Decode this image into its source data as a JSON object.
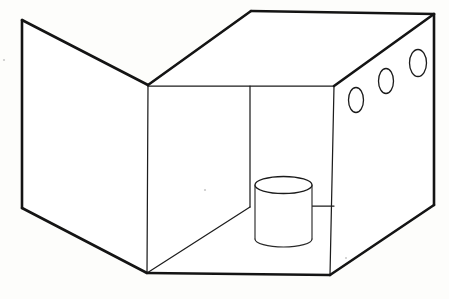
{
  "document": {
    "title": "Open-box perspective line drawing",
    "subject": "three-dimensional box with open front, three circular holes on right wall, and a cylinder resting on the floor",
    "style": "black ink line drawing on white paper",
    "canvas": {
      "width": 449,
      "height": 299
    },
    "background_color": "#fdfdfb",
    "ink_color": "#141414"
  },
  "geometry": {
    "vertices": {
      "left_panel_top_outer": [
        22,
        20
      ],
      "left_panel_bottom_outer": [
        22,
        208
      ],
      "left_panel_top_inner": [
        148,
        85
      ],
      "left_panel_bottom_inner": [
        147,
        273
      ],
      "top_face_back_left": [
        251,
        11
      ],
      "top_face_back_right": [
        434,
        14
      ],
      "right_wall_top_front": [
        334,
        86
      ],
      "right_wall_bottom_outer": [
        434,
        205
      ],
      "floor_front_right": [
        330,
        275
      ],
      "back_wall_divider_top": [
        250,
        86
      ],
      "back_wall_divider_bottom": [
        250,
        207
      ]
    },
    "outer_outline_points": "22,20 148,85 251,11 434,14 434,205 330,275 147,273 22,208 22,20",
    "thick_edges": [
      {
        "name": "left-panel-left-edge",
        "points": "22,20 22,208"
      },
      {
        "name": "left-panel-top-edge",
        "points": "22,20 148,85"
      },
      {
        "name": "left-panel-bottom-edge",
        "points": "22,208 147,273"
      },
      {
        "name": "top-face-back-left-edge",
        "points": "148,85 251,11"
      },
      {
        "name": "top-face-back-edge",
        "points": "251,11 434,14"
      },
      {
        "name": "top-face-right-edge",
        "points": "434,14 334,86"
      },
      {
        "name": "right-wall-outer-edge",
        "points": "434,14 434,205"
      },
      {
        "name": "right-wall-bottom-edge",
        "points": "434,205 330,275"
      },
      {
        "name": "floor-front-edge",
        "points": "147,273 330,275"
      }
    ],
    "thin_edges": [
      {
        "name": "back-wall-top-rail",
        "points": "148,86 334,86"
      },
      {
        "name": "interior-left-wall-vertical",
        "points": "148,85 147,273"
      },
      {
        "name": "interior-right-wall-vertical",
        "points": "334,86 330,275"
      },
      {
        "name": "back-wall-vertical-divider",
        "points": "250,86 250,207"
      },
      {
        "name": "floor-diagonal",
        "points": "147,273 250,207"
      },
      {
        "name": "floor-right-ledge",
        "points": "312,206 334,206"
      }
    ]
  },
  "objects": {
    "cylinder": {
      "label": "cylinder",
      "center_x": 283.5,
      "top_ellipse_cy": 185,
      "rx": 28.5,
      "ry": 8.5,
      "body_bottom_y": 239,
      "bottom_arc_depth_y": 247,
      "left_x": 255,
      "right_x": 312
    },
    "right_wall_holes": {
      "label": "three circular holes",
      "count": 3,
      "items": [
        {
          "name": "hole-1",
          "cx": 356,
          "cy": 100,
          "rx": 7.5,
          "ry": 12.5
        },
        {
          "name": "hole-2",
          "cx": 386,
          "cy": 81,
          "rx": 7.5,
          "ry": 12.5
        },
        {
          "name": "hole-3",
          "cx": 418,
          "cy": 63,
          "rx": 8.5,
          "ry": 13.5
        }
      ]
    },
    "specks": [
      {
        "name": "speck-left-margin",
        "cx": 4,
        "cy": 60,
        "r": 1.1
      },
      {
        "name": "speck-interior-wall",
        "cx": 205,
        "cy": 190,
        "r": 1.1
      },
      {
        "name": "speck-floor-right",
        "cx": 346,
        "cy": 258,
        "r": 1.0
      }
    ]
  }
}
